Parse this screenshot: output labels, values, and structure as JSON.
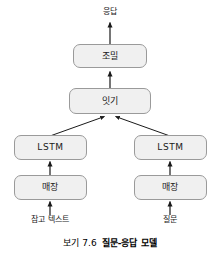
{
  "figure": {
    "output_label": "응답",
    "nodes": [
      {
        "id": "dense",
        "label": "조밀"
      },
      {
        "id": "concatenate",
        "label": "잇기"
      },
      {
        "id": "lstm-left",
        "label": "LSTM"
      },
      {
        "id": "lstm-right",
        "label": "LSTM"
      },
      {
        "id": "embed-left",
        "label": "매장"
      },
      {
        "id": "embed-right",
        "label": "매장"
      }
    ],
    "inputs": [
      {
        "id": "reference-text",
        "label": "참고 텍스트"
      },
      {
        "id": "question",
        "label": "질문"
      }
    ],
    "caption": {
      "number": "보기 7.6",
      "title": "질문-응답 모델"
    },
    "colors": {
      "box_fill": "#f0f0f0",
      "box_border": "#9a9a9a",
      "arrow": "#1a1a1a",
      "text": "#1a1a1a"
    }
  }
}
